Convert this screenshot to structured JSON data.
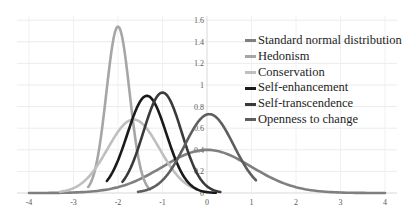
{
  "chart_data": {
    "type": "line",
    "title": "",
    "xlabel": "",
    "ylabel": "",
    "xlim": [
      -4,
      4
    ],
    "ylim": [
      0,
      1.6
    ],
    "x_ticks": [
      "-4",
      "-3",
      "-2",
      "-1",
      "0",
      "1",
      "2",
      "3",
      "4"
    ],
    "y_ticks": [
      "0",
      "0.2",
      "0.4",
      "0.6",
      "0.8",
      "1",
      "1.2",
      "1.4",
      "1.6"
    ],
    "grid": true,
    "legend_position": "right-inside",
    "series": [
      {
        "name": "Standard normal distribution",
        "distribution": "normal",
        "mean": 0.0,
        "sd": 1.0,
        "peak": 0.4,
        "x_range": [
          -4.0,
          4.0
        ],
        "color": "#7f7f7f"
      },
      {
        "name": "Hedonism",
        "distribution": "normal",
        "mean": -2.0,
        "sd": 0.26,
        "peak": 1.54,
        "x_range": [
          -2.67,
          -1.28
        ],
        "color": "#a6a6a6"
      },
      {
        "name": "Conservation",
        "distribution": "normal",
        "mean": -1.65,
        "sd": 0.58,
        "peak": 0.68,
        "x_range": [
          -3.3,
          -0.22
        ],
        "color": "#bfbfbf"
      },
      {
        "name": "Self-enhancement",
        "distribution": "normal",
        "mean": -1.35,
        "sd": 0.44,
        "peak": 0.9,
        "x_range": [
          -2.25,
          0.2
        ],
        "color": "#1a1a1a"
      },
      {
        "name": "Self-transcendence",
        "distribution": "normal",
        "mean": -1.0,
        "sd": 0.43,
        "peak": 0.93,
        "x_range": [
          -1.9,
          0.3
        ],
        "color": "#3a3a3a"
      },
      {
        "name": "Openness to change",
        "distribution": "normal",
        "mean": 0.05,
        "sd": 0.55,
        "peak": 0.73,
        "x_range": [
          -1.55,
          1.1
        ],
        "color": "#5e5e5e"
      }
    ]
  }
}
